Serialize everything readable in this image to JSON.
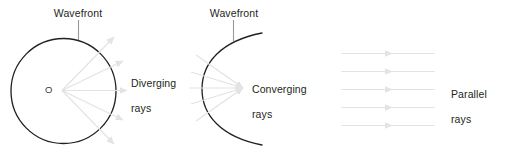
{
  "figure": {
    "width": 505,
    "height": 154,
    "background": "#ffffff",
    "cut_off_top_line": "  ",
    "colors": {
      "wavefront_stroke": "#231f20",
      "ray_stroke": "#e3e3e5",
      "leader_stroke": "#9a9a9c",
      "text": "#231f20",
      "center_label": "#3a3a3a"
    }
  },
  "panels": {
    "diverging": {
      "wavefront_label": "Wavefront",
      "center_label": "O",
      "rays_label": "Diverging\nrays",
      "rays_label_line1": "Diverging",
      "rays_label_line2": "rays",
      "shape": "circle",
      "ray_count": 5
    },
    "converging": {
      "wavefront_label": "Wavefront",
      "rays_label": "Converging\nrays",
      "rays_label_line1": "Converging",
      "rays_label_line2": "rays",
      "shape": "arc",
      "ray_count": 5
    },
    "parallel": {
      "rays_label": "Parallel\nrays",
      "rays_label_line1": "Parallel",
      "rays_label_line2": "rays",
      "shape": "parallel-lines",
      "ray_count": 5
    }
  }
}
